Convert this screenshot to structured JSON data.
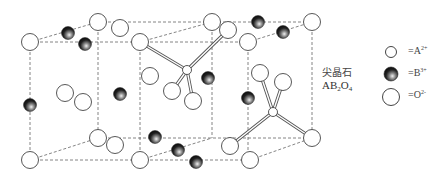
{
  "colors": {
    "background": "#ffffff",
    "line": "#555555",
    "atom_outline": "#444444",
    "b_atom_dark": "#1a1a1a",
    "b_atom_light": "#e8e8e8"
  },
  "caption": {
    "name_cn": "尖晶石",
    "formula_parts": [
      "AB",
      "2",
      "O",
      "4"
    ]
  },
  "legend": {
    "items": [
      {
        "symbol": "small-open-circle",
        "label": "=A",
        "charge": "2+"
      },
      {
        "symbol": "dark-shaded-sphere",
        "label": "=B",
        "charge": "3+"
      },
      {
        "symbol": "large-open-circle",
        "label": "=O",
        "charge": "2-"
      }
    ]
  },
  "structure": {
    "oxygen_atoms": [
      [
        30,
        42
      ],
      [
        98,
        22
      ],
      [
        140,
        42
      ],
      [
        212,
        22
      ],
      [
        248,
        42
      ],
      [
        312,
        22
      ],
      [
        120,
        28
      ],
      [
        228,
        30
      ],
      [
        150,
        76
      ],
      [
        65,
        93
      ],
      [
        83,
        102
      ],
      [
        172,
        91
      ],
      [
        193,
        101
      ],
      [
        260,
        73
      ],
      [
        283,
        82
      ],
      [
        30,
        160
      ],
      [
        98,
        138
      ],
      [
        140,
        160
      ],
      [
        115,
        145
      ],
      [
        250,
        160
      ],
      [
        312,
        138
      ],
      [
        230,
        146
      ]
    ],
    "b_atoms": [
      [
        68,
        33
      ],
      [
        85,
        44
      ],
      [
        30,
        105
      ],
      [
        120,
        94
      ],
      [
        208,
        78
      ],
      [
        258,
        22
      ],
      [
        283,
        32
      ],
      [
        248,
        98
      ],
      [
        155,
        137
      ],
      [
        178,
        150
      ],
      [
        196,
        162
      ]
    ],
    "a_atoms": [
      [
        187,
        70
      ],
      [
        273,
        112
      ]
    ],
    "dashed_edges": [
      [
        30,
        42,
        140,
        42
      ],
      [
        98,
        22,
        312,
        22
      ],
      [
        30,
        42,
        98,
        22
      ],
      [
        140,
        42,
        212,
        22
      ],
      [
        248,
        42,
        312,
        22
      ],
      [
        140,
        42,
        248,
        42
      ],
      [
        30,
        42,
        30,
        160
      ],
      [
        98,
        22,
        98,
        138
      ],
      [
        140,
        42,
        140,
        160
      ],
      [
        212,
        22,
        212,
        138
      ],
      [
        248,
        42,
        248,
        160
      ],
      [
        312,
        22,
        312,
        138
      ],
      [
        30,
        160,
        250,
        160
      ],
      [
        98,
        138,
        312,
        138
      ],
      [
        30,
        160,
        98,
        138
      ],
      [
        140,
        160,
        212,
        138
      ],
      [
        250,
        160,
        312,
        138
      ]
    ],
    "bonds": [
      [
        140,
        42,
        187,
        70
      ],
      [
        228,
        30,
        187,
        70
      ],
      [
        187,
        70,
        172,
        91
      ],
      [
        187,
        70,
        193,
        101
      ],
      [
        273,
        112,
        260,
        73
      ],
      [
        273,
        112,
        283,
        82
      ],
      [
        273,
        112,
        230,
        146
      ],
      [
        273,
        112,
        312,
        138
      ]
    ]
  }
}
